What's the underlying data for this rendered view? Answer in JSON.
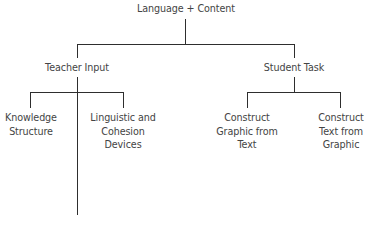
{
  "diagram": {
    "type": "tree",
    "root": {
      "label": "Language + Content",
      "children": [
        {
          "label": "Teacher Input",
          "children": [
            {
              "label": "Knowledge Structure",
              "lines": [
                "Knowledge",
                "Structure"
              ]
            },
            {
              "label": "Linguistic and Cohesion Devices",
              "lines": [
                "Linguistic and",
                "Cohesion",
                "Devices"
              ]
            }
          ]
        },
        {
          "label": "Student Task",
          "children": [
            {
              "label": "Construct Graphic from Text",
              "lines": [
                "Construct",
                "Graphic from",
                "Text"
              ]
            },
            {
              "label": "Construct Text from Graphic",
              "lines": [
                "Construct",
                "Text from",
                "Graphic"
              ]
            }
          ]
        }
      ]
    },
    "line_color": "#2e2e2e",
    "text_color": "#444444"
  }
}
